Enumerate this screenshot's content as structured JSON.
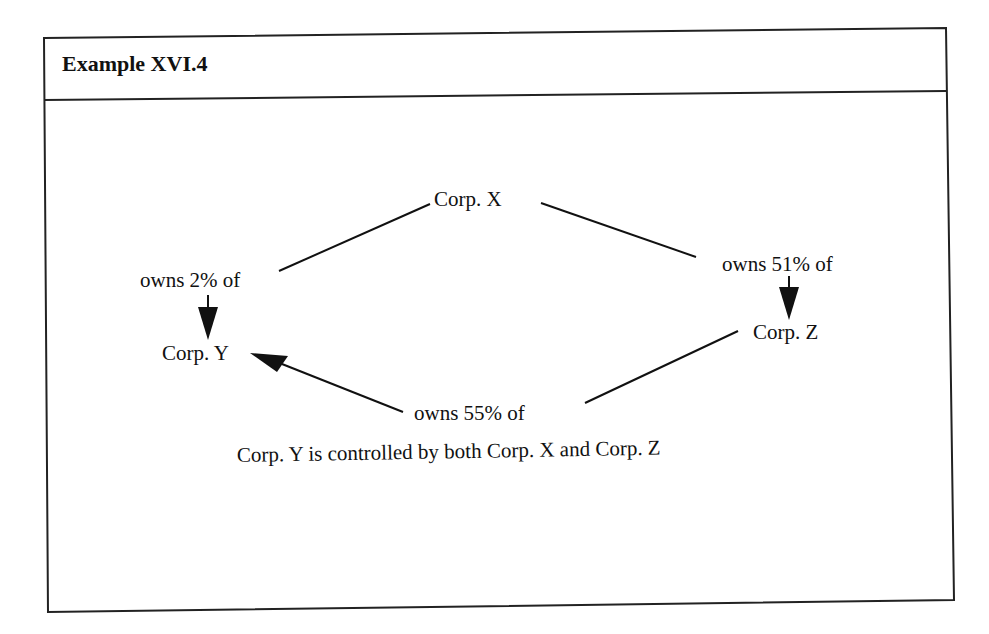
{
  "header": {
    "title": "Example XVI.4"
  },
  "diagram": {
    "nodes": [
      {
        "id": "corp_x",
        "label": "Corp. X"
      },
      {
        "id": "corp_y",
        "label": "Corp. Y"
      },
      {
        "id": "corp_z",
        "label": "Corp. Z"
      }
    ],
    "edges": [
      {
        "from": "corp_x",
        "to": "corp_y",
        "label": "owns 2% of"
      },
      {
        "from": "corp_x",
        "to": "corp_z",
        "label": "owns 51% of"
      },
      {
        "from": "corp_z",
        "to": "corp_y",
        "label": "owns 55% of"
      }
    ],
    "caption": "Corp. Y is controlled by both Corp. X and Corp. Z"
  },
  "colors": {
    "ink": "#111111",
    "background": "#ffffff"
  }
}
